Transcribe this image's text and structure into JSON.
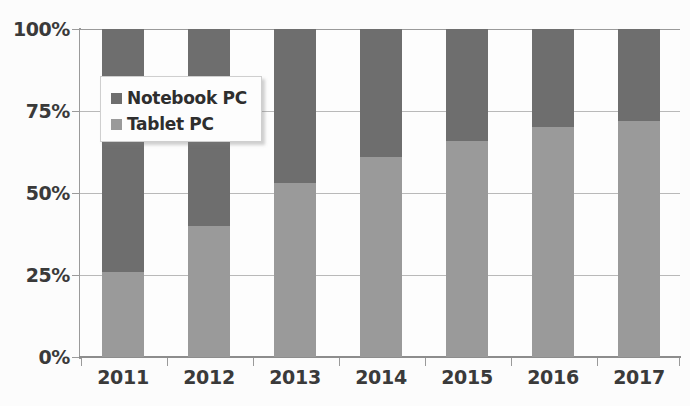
{
  "chart_data": {
    "type": "bar",
    "variant": "stacked-100-percent",
    "title": "",
    "subtitle": "",
    "xlabel": "",
    "ylabel": "",
    "categories": [
      "2011",
      "2012",
      "2013",
      "2014",
      "2015",
      "2016",
      "2017"
    ],
    "series": [
      {
        "name": "Tablet PC",
        "color": "#9a9a9a",
        "values": [
          26,
          40,
          53,
          61,
          66,
          70,
          72
        ]
      },
      {
        "name": "Notebook PC",
        "color": "#6e6e6e",
        "values": [
          74,
          60,
          47,
          39,
          34,
          30,
          28
        ]
      }
    ],
    "ylim": [
      0,
      100
    ],
    "yticks": [
      0,
      25,
      50,
      75,
      100
    ],
    "ytick_labels": [
      "0%",
      "25%",
      "50%",
      "75%",
      "100%"
    ],
    "grid": true,
    "legend_position": "upper-left-inside",
    "legend_entries": [
      "Notebook PC",
      "Tablet PC"
    ],
    "stack_order_bottom_to_top": [
      "Tablet PC",
      "Notebook PC"
    ]
  },
  "axes": {
    "y_tick_labels": [
      "100%",
      "75%",
      "50%",
      "25%",
      "0%"
    ],
    "x_tick_labels": [
      "2011",
      "2012",
      "2013",
      "2014",
      "2015",
      "2016",
      "2017"
    ]
  },
  "legend": {
    "items": [
      {
        "label": "Notebook PC",
        "swatch_color": "#6e6e6e"
      },
      {
        "label": "Tablet PC",
        "swatch_color": "#9a9a9a"
      }
    ]
  },
  "colors": {
    "notebook": "#6e6e6e",
    "tablet": "#9a9a9a",
    "gridline": "#b9b9b9",
    "axis": "#8d8d8d",
    "text": "#3a3a3a",
    "background": "#fcfcfc"
  }
}
